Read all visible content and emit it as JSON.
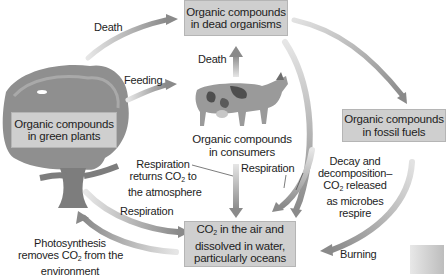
{
  "diagram": {
    "type": "cycle-flow",
    "colors": {
      "box_fill": "#cfcfcf",
      "box_border": "#b5b5b5",
      "arrow_light": "#d9d9d9",
      "arrow_dark": "#8c8c8c",
      "text": "#1d1d1d"
    },
    "nodes": {
      "dead_organisms": {
        "line1": "Organic compounds",
        "line2": "in dead organisms"
      },
      "green_plants": {
        "line1": "Organic compounds",
        "line2": "in green plants"
      },
      "consumers": {
        "line1": "Organic compounds",
        "line2": "in consumers"
      },
      "fossil_fuels": {
        "line1": "Organic compounds",
        "line2": "in fossil fuels"
      },
      "co2_reservoir": {
        "line1_pre": "CO",
        "line1_sub": "2",
        "line1_post": " in the air and",
        "line2": "dissolved in water,",
        "line3": "particularly oceans"
      }
    },
    "edges": {
      "plants_to_dead": "Death",
      "plants_to_consumers": "Feeding",
      "consumers_to_dead": "Death",
      "consumers_to_co2": "Respiration",
      "dead_to_co2": "Respiration",
      "plants_to_co2": "Respiration",
      "fossil_to_co2": "Burning"
    },
    "annotations": {
      "respiration_returns": {
        "line1": "Respiration",
        "line2_pre": "returns CO",
        "line2_sub": "2",
        "line2_post": " to",
        "line3": "the atmosphere"
      },
      "decay": {
        "line1": "Decay and",
        "line2": "decomposition–",
        "line3_pre": "CO",
        "line3_sub": "2",
        "line3_post": " released",
        "line4": "as microbes",
        "line5": "respire"
      },
      "photosynthesis": {
        "line1": "Photosynthesis",
        "line2_pre": "removes CO",
        "line2_sub": "2",
        "line2_post": " from the",
        "line3": "environment"
      }
    },
    "illustrations": {
      "tree": "tree-illustration",
      "cow": "cow-illustration"
    }
  }
}
